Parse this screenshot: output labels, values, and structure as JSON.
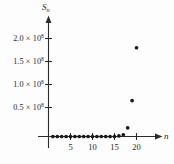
{
  "figure": {
    "background_color": "#fdfdfd",
    "ink_color": "#2b2b2b",
    "point_color": "#1a1a1a"
  },
  "axes": {
    "y_axis_name": "S",
    "y_axis_subscript": "n",
    "x_axis_name": "n",
    "y_ticks": [
      {
        "label_mantissa": "0.5",
        "times": "×",
        "base": "10",
        "exponent": "8",
        "value": 50000000
      },
      {
        "label_mantissa": "1.0",
        "times": "×",
        "base": "10",
        "exponent": "8",
        "value": 100000000
      },
      {
        "label_mantissa": "1.5",
        "times": "×",
        "base": "10",
        "exponent": "8",
        "value": 150000000
      },
      {
        "label_mantissa": "2.0",
        "times": "×",
        "base": "10",
        "exponent": "8",
        "value": 200000000
      }
    ],
    "x_ticks": [
      {
        "label": "5",
        "value": 5
      },
      {
        "label": "10",
        "value": 10
      },
      {
        "label": "15",
        "value": 15
      },
      {
        "label": "20",
        "value": 20
      }
    ]
  },
  "chart_data": {
    "type": "scatter",
    "title": "",
    "xlabel": "n",
    "ylabel": "S_n",
    "xlim": [
      0,
      22
    ],
    "ylim": [
      0,
      215000000
    ],
    "grid": false,
    "legend": null,
    "marker": "filled-circle",
    "x": [
      1,
      2,
      3,
      4,
      5,
      6,
      7,
      8,
      9,
      10,
      11,
      12,
      13,
      14,
      15,
      16,
      17,
      18,
      19,
      20
    ],
    "y": [
      120000,
      260000,
      420000,
      640000,
      940000,
      1300000,
      1800000,
      2400000,
      3100000,
      3900000,
      4800000,
      5900000,
      7100000,
      8600000,
      10500000,
      13500000,
      20000000,
      37000000,
      85000000,
      205000000
    ],
    "y_display": [
      0,
      0,
      0,
      0,
      0,
      0,
      0,
      0,
      0,
      0,
      0,
      0,
      0,
      0,
      0,
      1000000,
      3000000,
      15000000,
      62000000,
      153000000
    ]
  }
}
